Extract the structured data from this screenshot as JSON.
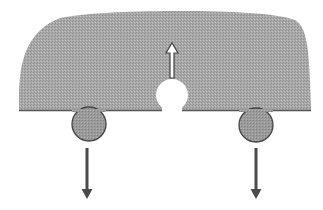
{
  "diagram": {
    "colors": {
      "background": "#ffffff",
      "slab_fill": "#a9a9a9",
      "slab_edge": "#555555",
      "sphere_fill": "#9a9a9a",
      "sphere_edge": "#444444",
      "down_arrow": "#4a4a4a",
      "up_arrow_outline": "#444444",
      "up_arrow_fill": "#ffffff",
      "cavity_fill": "#ffffff"
    },
    "elements": {
      "slab": {
        "label": "slab",
        "base_y": 110,
        "left_x": 19,
        "right_x": 311,
        "top_y": 12
      },
      "cavity": {
        "label": "cavity",
        "cx": 172,
        "cy": 95,
        "r": 16
      },
      "up_arrow": {
        "label": "upward force",
        "x": 172,
        "y_top": 42,
        "y_bottom": 78,
        "style": "hollow"
      },
      "left_sphere": {
        "label": "left sphere",
        "cx": 89,
        "cy": 124,
        "r": 17
      },
      "right_sphere": {
        "label": "right sphere",
        "cx": 256,
        "cy": 125,
        "r": 17
      },
      "left_down_arrow": {
        "label": "left downward force",
        "x": 87,
        "y_top": 148,
        "y_bottom": 199,
        "style": "solid"
      },
      "right_down_arrow": {
        "label": "right downward force",
        "x": 256,
        "y_top": 148,
        "y_bottom": 199,
        "style": "solid"
      }
    }
  }
}
